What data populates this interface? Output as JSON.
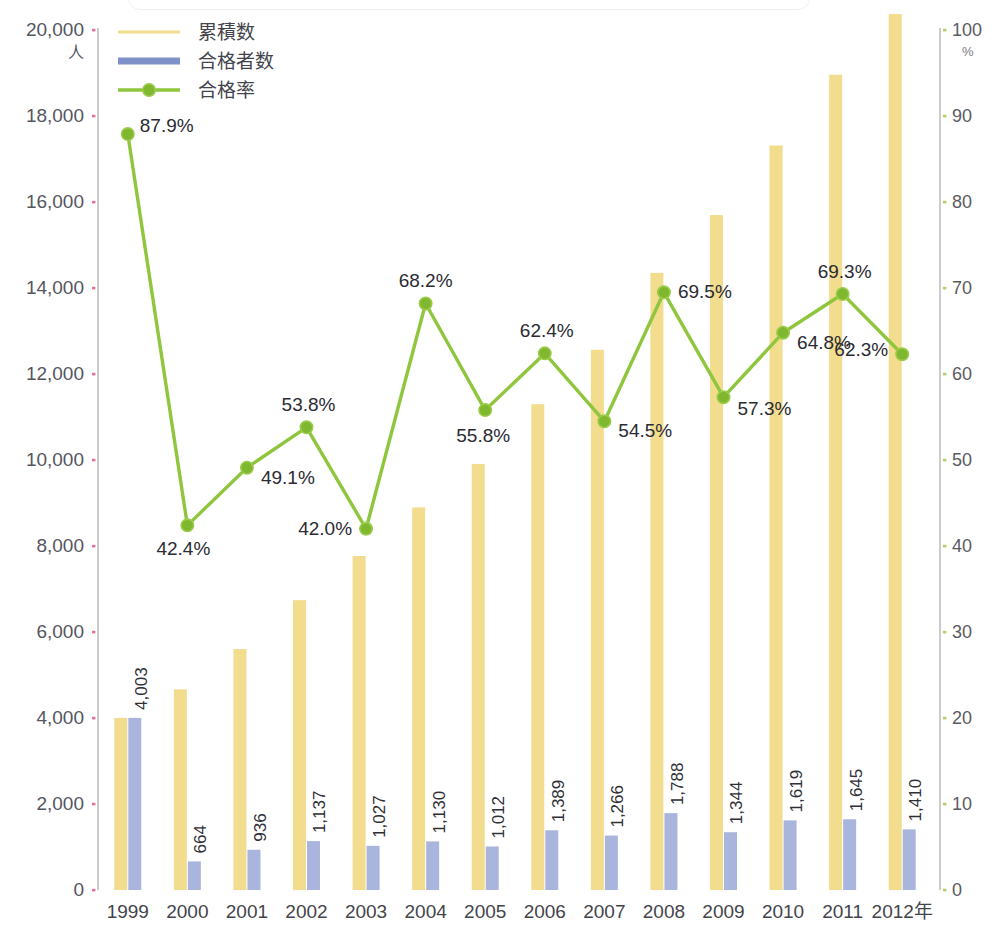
{
  "chart_data": {
    "type": "bar",
    "title": "",
    "subtitle": "",
    "xlabel": "",
    "ylabel": "人",
    "y2label": "%",
    "grid": false,
    "legend_position": "top-left",
    "categories": [
      "1999",
      "2000",
      "2001",
      "2002",
      "2003",
      "2004",
      "2005",
      "2006",
      "2007",
      "2008",
      "2009",
      "2010",
      "2011",
      "2012"
    ],
    "x_axis_suffix": "年",
    "x_tick_labels": [
      "1999",
      "2000",
      "2001",
      "2002",
      "2003",
      "2004",
      "2005",
      "2006",
      "2007",
      "2008",
      "2009",
      "2010",
      "2011",
      "2012年"
    ],
    "ylim": [
      0,
      20000
    ],
    "y_ticks": [
      0,
      2000,
      4000,
      6000,
      8000,
      10000,
      12000,
      14000,
      16000,
      18000,
      20000
    ],
    "y_tick_labels": [
      "0",
      "2,000",
      "4,000",
      "6,000",
      "8,000",
      "10,000",
      "12,000",
      "14,000",
      "16,000",
      "18,000",
      "20,000"
    ],
    "y2lim": [
      0,
      100
    ],
    "y2_ticks": [
      0,
      10,
      20,
      30,
      40,
      50,
      60,
      70,
      80,
      90,
      100
    ],
    "y2_tick_labels": [
      "0",
      "10",
      "20",
      "30",
      "40",
      "50",
      "60",
      "70",
      "80",
      "90",
      "100"
    ],
    "series": [
      {
        "name": "累積数",
        "type": "bar",
        "axis": "left",
        "color": "#F2DC8E",
        "values": [
          4003,
          4667,
          5603,
          6740,
          7767,
          8897,
          9909,
          11298,
          12564,
          14352,
          15696,
          17315,
          18960,
          20370
        ],
        "data_labels_shown": false
      },
      {
        "name": "合格者数",
        "type": "bar",
        "axis": "left",
        "color": "#A9B5DC",
        "values": [
          4003,
          664,
          936,
          1137,
          1027,
          1130,
          1012,
          1389,
          1266,
          1788,
          1344,
          1619,
          1645,
          1410
        ],
        "data_labels": [
          "4,003",
          "664",
          "936",
          "1,137",
          "1,027",
          "1,130",
          "1,012",
          "1,389",
          "1,266",
          "1,788",
          "1,344",
          "1,619",
          "1,645",
          "1,410"
        ],
        "data_labels_shown": true,
        "data_label_rotation": -90
      },
      {
        "name": "合格率",
        "type": "line",
        "axis": "right",
        "color": "#8FC63D",
        "marker": "circle",
        "values": [
          87.9,
          42.4,
          49.1,
          53.8,
          42.0,
          68.2,
          55.8,
          62.4,
          54.5,
          69.5,
          57.3,
          64.8,
          69.3,
          62.3
        ],
        "data_labels": [
          "87.9%",
          "42.4%",
          "49.1%",
          "53.8%",
          "42.0%",
          "68.2%",
          "55.8%",
          "62.4%",
          "54.5%",
          "69.5%",
          "57.3%",
          "64.8%",
          "69.3%",
          "62.3%"
        ],
        "data_labels_shown": true
      }
    ]
  },
  "legend": {
    "items": [
      {
        "label": "累積数",
        "color": "#F2DC8E",
        "style": "line-thin"
      },
      {
        "label": "合格者数",
        "color": "#8090C8",
        "style": "line-thick"
      },
      {
        "label": "合格率",
        "color": "#8FC63D",
        "style": "line-marker"
      }
    ]
  },
  "axes": {
    "left_unit": "人",
    "right_unit": "%",
    "left_axis_color": "#bdbdc4",
    "right_axis_color": "#bdbdc4",
    "left_tick_color": "#e2739a",
    "right_tick_color": "#b6cf63"
  },
  "colors": {
    "cumulative_bar": "#F2DC8E",
    "passers_bar": "#A9B5DC",
    "rate_line": "#8FC63D",
    "text": "#3b3b44",
    "background": "#FFFFFF"
  }
}
